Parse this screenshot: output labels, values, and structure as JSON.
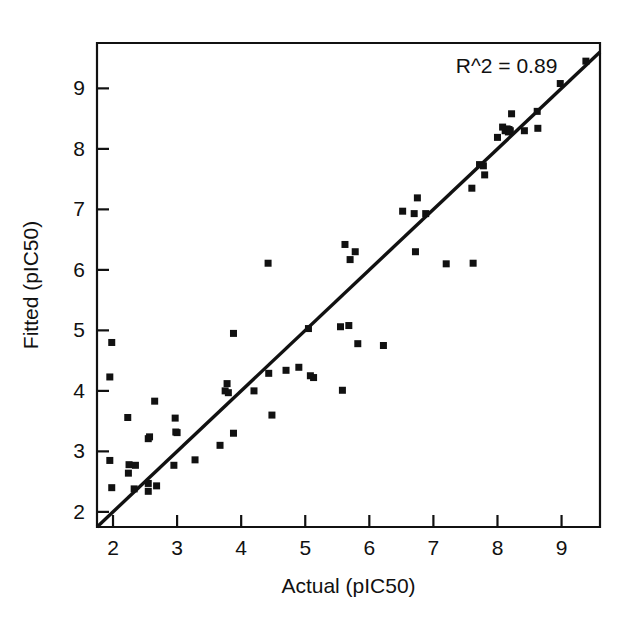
{
  "chart_data": {
    "type": "scatter",
    "title": "",
    "xlabel": "Actual (pIC50)",
    "ylabel": "Fitted (pIC50)",
    "xlim": [
      1.75,
      9.6
    ],
    "ylim": [
      1.75,
      9.75
    ],
    "xticks": [
      2,
      3,
      4,
      5,
      6,
      7,
      8,
      9
    ],
    "yticks": [
      2,
      3,
      4,
      5,
      6,
      7,
      8,
      9
    ],
    "xticklabels": [
      "2",
      "3",
      "4",
      "5",
      "6",
      "7",
      "8",
      "9"
    ],
    "yticklabels": [
      "2",
      "3",
      "4",
      "5",
      "6",
      "7",
      "8",
      "9"
    ],
    "grid": false,
    "legend": false,
    "annotations": [
      {
        "text": "R^2 = 0.89",
        "x": 7.35,
        "y": 9.25
      }
    ],
    "reference_line": {
      "label": "identity-line",
      "x0": 1.75,
      "y0": 1.75,
      "x1": 9.6,
      "y1": 9.6
    },
    "marker": {
      "shape": "square",
      "color": "#111111",
      "size": 7
    },
    "series": [
      {
        "name": "compounds",
        "points": [
          [
            1.98,
            4.8
          ],
          [
            1.95,
            4.23
          ],
          [
            1.95,
            2.85
          ],
          [
            1.98,
            2.4
          ],
          [
            2.23,
            3.56
          ],
          [
            2.25,
            2.78
          ],
          [
            2.24,
            2.64
          ],
          [
            2.35,
            2.77
          ],
          [
            2.33,
            2.38
          ],
          [
            2.55,
            3.21
          ],
          [
            2.57,
            3.24
          ],
          [
            2.55,
            2.47
          ],
          [
            2.55,
            2.34
          ],
          [
            2.65,
            3.83
          ],
          [
            2.68,
            2.43
          ],
          [
            2.97,
            3.55
          ],
          [
            2.98,
            3.32
          ],
          [
            3.0,
            3.31
          ],
          [
            2.95,
            2.77
          ],
          [
            3.28,
            2.86
          ],
          [
            3.67,
            3.1
          ],
          [
            3.75,
            4.0
          ],
          [
            3.78,
            4.12
          ],
          [
            3.8,
            3.97
          ],
          [
            3.88,
            4.95
          ],
          [
            3.88,
            3.3
          ],
          [
            4.2,
            4.0
          ],
          [
            4.42,
            6.11
          ],
          [
            4.43,
            4.29
          ],
          [
            4.48,
            3.6
          ],
          [
            4.7,
            4.34
          ],
          [
            4.9,
            4.39
          ],
          [
            5.05,
            5.03
          ],
          [
            5.08,
            4.25
          ],
          [
            5.13,
            4.22
          ],
          [
            5.55,
            5.06
          ],
          [
            5.58,
            4.01
          ],
          [
            5.62,
            6.42
          ],
          [
            5.68,
            5.08
          ],
          [
            5.7,
            6.17
          ],
          [
            5.78,
            6.3
          ],
          [
            5.82,
            4.78
          ],
          [
            6.22,
            4.75
          ],
          [
            6.52,
            6.97
          ],
          [
            6.7,
            6.93
          ],
          [
            6.72,
            6.3
          ],
          [
            6.75,
            7.19
          ],
          [
            6.88,
            6.93
          ],
          [
            7.2,
            6.1
          ],
          [
            7.6,
            7.35
          ],
          [
            7.62,
            6.11
          ],
          [
            7.72,
            7.74
          ],
          [
            7.78,
            7.72
          ],
          [
            7.8,
            7.57
          ],
          [
            8.0,
            8.19
          ],
          [
            8.08,
            8.36
          ],
          [
            8.12,
            8.3
          ],
          [
            8.15,
            8.33
          ],
          [
            8.17,
            8.28
          ],
          [
            8.18,
            8.32
          ],
          [
            8.2,
            8.3
          ],
          [
            8.22,
            8.58
          ],
          [
            8.42,
            8.3
          ],
          [
            8.62,
            8.62
          ],
          [
            8.63,
            8.34
          ],
          [
            8.98,
            9.08
          ],
          [
            9.38,
            9.45
          ]
        ]
      }
    ]
  },
  "axes": {
    "x_title": "Actual (pIC50)",
    "y_title": "Fitted (pIC50)"
  },
  "annotation": {
    "r_squared_label": "R^2 = 0.89"
  }
}
